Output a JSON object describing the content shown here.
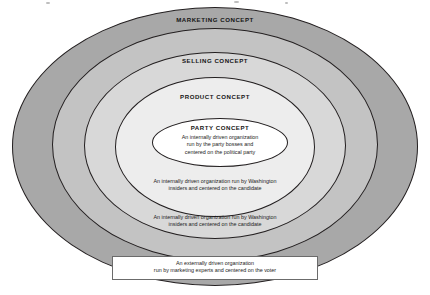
{
  "diagram": {
    "type": "concentric-ellipse-onion",
    "title": "",
    "rings": [
      {
        "id": "marketing",
        "label": "MARKETING CONCEPT",
        "caption": "",
        "fill": "#a8a8a8",
        "level": 1
      },
      {
        "id": "selling",
        "label": "SELLING CONCEPT",
        "caption_line1": "An internally driven organization run by Washington",
        "caption_line2": "insiders and centered on the candidate",
        "fill": "#c3c3c3",
        "level": 2
      },
      {
        "id": "product",
        "label": "PRODUCT CONCEPT",
        "caption_line1": "An internally driven organization run by Washington",
        "caption_line2": "insiders and centered on the candidate",
        "fill": "#d8d8d8",
        "level": 3
      },
      {
        "id": "party",
        "label": "PARTY CONCEPT",
        "caption": "",
        "fill": "#ededed",
        "level": 4
      }
    ],
    "core": {
      "title": "PARTY CONCEPT",
      "line1": "An internally driven organization",
      "line2": "run by the party bosses and",
      "line3": "centered on the political party",
      "fill": "#ffffff"
    },
    "callout": {
      "line1": "An externally driven organization",
      "line2": "run by marketing experts and centered on the voter",
      "fill": "#ffffff"
    },
    "colors": {
      "outline": "#231f20",
      "text": "#1c1c1c",
      "background": "#ffffff"
    }
  }
}
